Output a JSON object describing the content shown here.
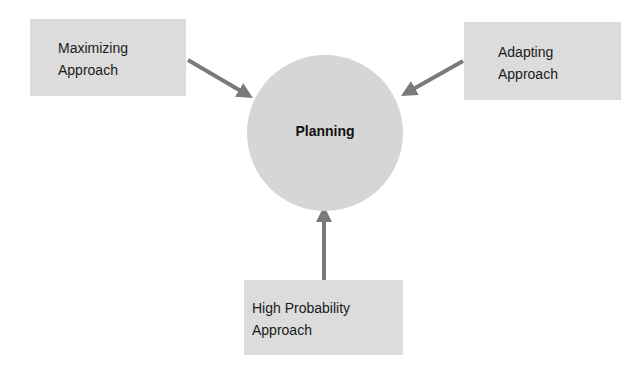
{
  "center": {
    "label": "Planning"
  },
  "approaches": [
    {
      "line1": "Maximizing",
      "line2": "Approach"
    },
    {
      "line1": "Adapting",
      "line2": "Approach"
    },
    {
      "line1": "High Probability",
      "line2": "Approach"
    }
  ],
  "colors": {
    "box": "#dcdcdc",
    "circle": "#d6d6d6",
    "arrow": "#7a7a7a"
  }
}
